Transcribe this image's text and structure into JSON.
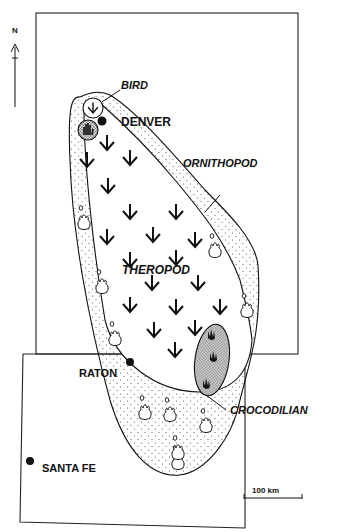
{
  "map": {
    "north_label": "N",
    "scale_label": "100 km",
    "cities": [
      {
        "name": "DENVER"
      },
      {
        "name": "RATON"
      },
      {
        "name": "SANTA FE"
      }
    ],
    "track_labels": {
      "bird": "BIRD",
      "ornithopod": "ORNITHOPOD",
      "theropod": "THEROPOD",
      "crocodilian": "CROCODILIAN"
    },
    "regions": [
      "Colorado",
      "New Mexico"
    ],
    "colors": {
      "ink": "#111111",
      "background": "#ffffff",
      "stipple": "#555555"
    }
  }
}
